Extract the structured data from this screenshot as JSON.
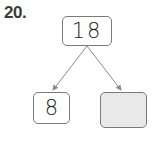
{
  "question": {
    "number": "20."
  },
  "number_bond": {
    "whole": "18",
    "parts": [
      {
        "value": "8",
        "blank": false
      },
      {
        "value": "",
        "blank": true
      }
    ]
  },
  "colors": {
    "line": "#8a8a8a",
    "blank_fill": "#e9e9e9",
    "border": "#7a7a7a"
  }
}
